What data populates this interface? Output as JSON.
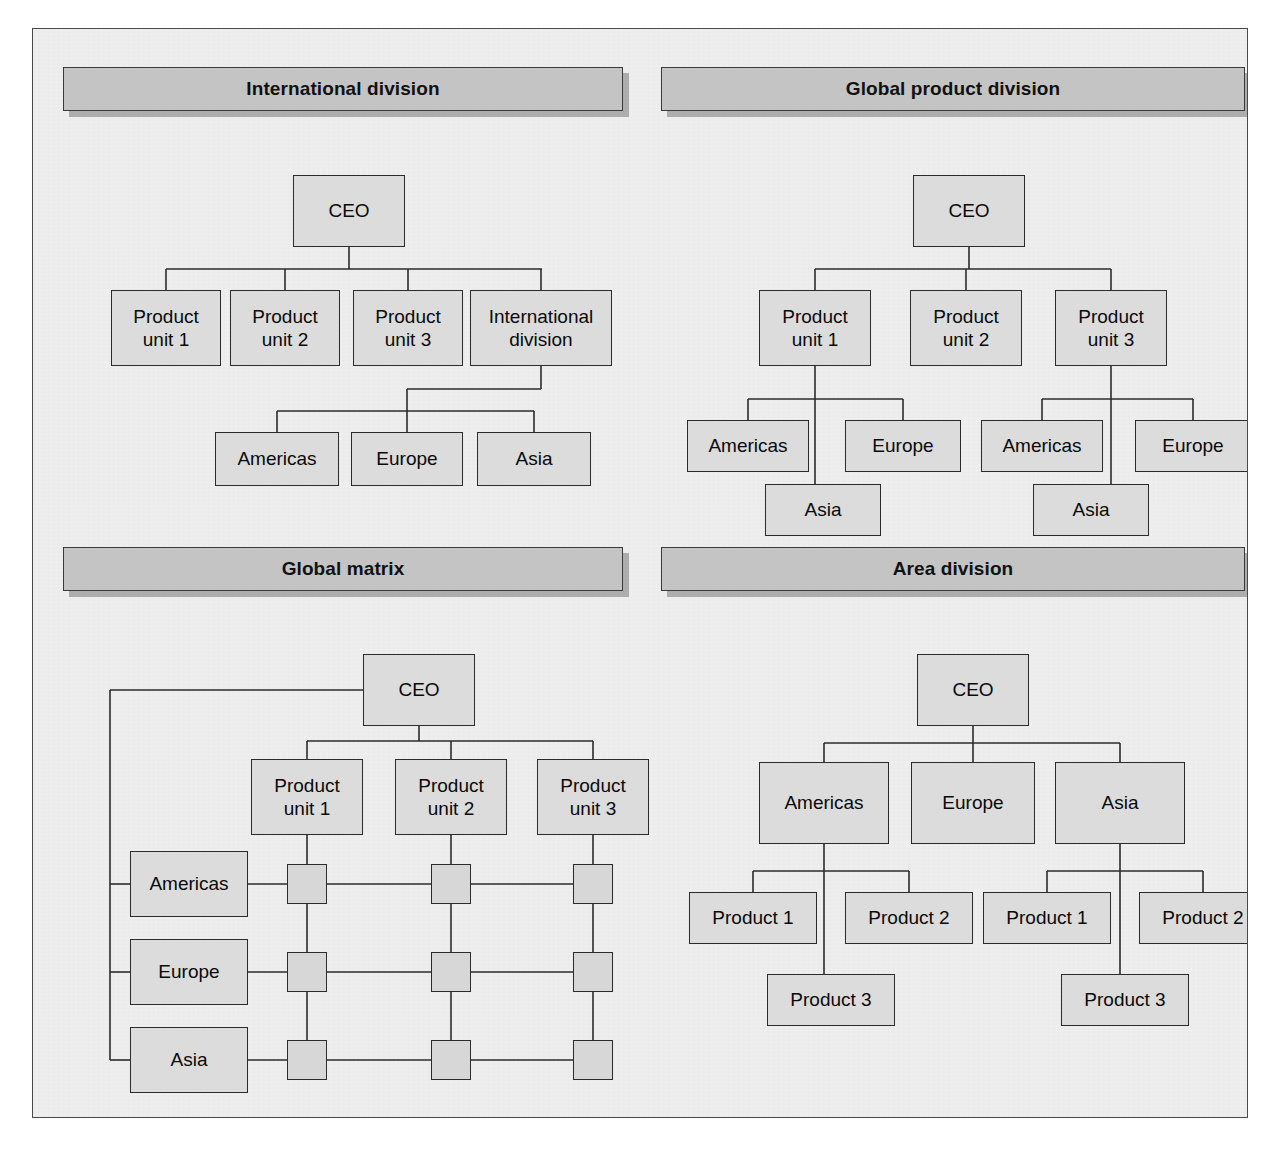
{
  "figure": {
    "background_color": "#eeeeee",
    "box_fill_color": "#dcdcdc",
    "banner_fill_color": "#c4c4c4",
    "line_color": "#2b2b2b"
  },
  "panels": [
    {
      "id": "international-division",
      "title": "International division",
      "nodes": [
        {
          "name": "ceo",
          "label": "CEO",
          "x": 260,
          "y": 146,
          "w": 112,
          "h": 72
        },
        {
          "name": "product-unit-1",
          "label": "Product\nunit 1",
          "x": 78,
          "y": 261,
          "w": 110,
          "h": 76
        },
        {
          "name": "product-unit-2",
          "label": "Product\nunit 2",
          "x": 197,
          "y": 261,
          "w": 110,
          "h": 76
        },
        {
          "name": "product-unit-3",
          "label": "Product\nunit 3",
          "x": 320,
          "y": 261,
          "w": 110,
          "h": 76
        },
        {
          "name": "international-div",
          "label": "International\ndivision",
          "x": 437,
          "y": 261,
          "w": 142,
          "h": 76
        },
        {
          "name": "americas",
          "label": "Americas",
          "x": 182,
          "y": 403,
          "w": 124,
          "h": 54
        },
        {
          "name": "europe",
          "label": "Europe",
          "x": 318,
          "y": 403,
          "w": 112,
          "h": 54
        },
        {
          "name": "asia",
          "label": "Asia",
          "x": 444,
          "y": 403,
          "w": 114,
          "h": 54
        }
      ]
    },
    {
      "id": "global-product-division",
      "title": "Global product division",
      "nodes": [
        {
          "name": "ceo",
          "label": "CEO",
          "x": 880,
          "y": 146,
          "w": 112,
          "h": 72
        },
        {
          "name": "product-unit-1",
          "label": "Product\nunit 1",
          "x": 726,
          "y": 261,
          "w": 112,
          "h": 76
        },
        {
          "name": "product-unit-2",
          "label": "Product\nunit 2",
          "x": 877,
          "y": 261,
          "w": 112,
          "h": 76
        },
        {
          "name": "product-unit-3",
          "label": "Product\nunit 3",
          "x": 1022,
          "y": 261,
          "w": 112,
          "h": 76
        },
        {
          "name": "americas-1",
          "label": "Americas",
          "x": 654,
          "y": 391,
          "w": 122,
          "h": 52
        },
        {
          "name": "europe-1",
          "label": "Europe",
          "x": 812,
          "y": 391,
          "w": 116,
          "h": 52
        },
        {
          "name": "asia-1",
          "label": "Asia",
          "x": 732,
          "y": 455,
          "w": 116,
          "h": 52
        },
        {
          "name": "americas-2",
          "label": "Americas",
          "x": 948,
          "y": 391,
          "w": 122,
          "h": 52
        },
        {
          "name": "europe-2",
          "label": "Europe",
          "x": 1102,
          "y": 391,
          "w": 116,
          "h": 52
        },
        {
          "name": "asia-2",
          "label": "Asia",
          "x": 1000,
          "y": 455,
          "w": 116,
          "h": 52
        }
      ]
    },
    {
      "id": "global-matrix",
      "title": "Global matrix",
      "nodes": [
        {
          "name": "ceo",
          "label": "CEO",
          "x": 330,
          "y": 625,
          "w": 112,
          "h": 72
        },
        {
          "name": "product-unit-1",
          "label": "Product\nunit 1",
          "x": 218,
          "y": 730,
          "w": 112,
          "h": 76
        },
        {
          "name": "product-unit-2",
          "label": "Product\nunit 2",
          "x": 362,
          "y": 730,
          "w": 112,
          "h": 76
        },
        {
          "name": "product-unit-3",
          "label": "Product\nunit 3",
          "x": 504,
          "y": 730,
          "w": 112,
          "h": 76
        },
        {
          "name": "americas",
          "label": "Americas",
          "x": 97,
          "y": 822,
          "w": 118,
          "h": 66
        },
        {
          "name": "europe",
          "label": "Europe",
          "x": 97,
          "y": 910,
          "w": 118,
          "h": 66
        },
        {
          "name": "asia",
          "label": "Asia",
          "x": 97,
          "y": 998,
          "w": 118,
          "h": 66
        }
      ],
      "matrix_nodes": [
        {
          "name": "cell-americas-unit-1",
          "x": 254,
          "y": 835,
          "w": 40,
          "h": 40
        },
        {
          "name": "cell-americas-unit-2",
          "x": 398,
          "y": 835,
          "w": 40,
          "h": 40
        },
        {
          "name": "cell-americas-unit-3",
          "x": 540,
          "y": 835,
          "w": 40,
          "h": 40
        },
        {
          "name": "cell-europe-unit-1",
          "x": 254,
          "y": 923,
          "w": 40,
          "h": 40
        },
        {
          "name": "cell-europe-unit-2",
          "x": 398,
          "y": 923,
          "w": 40,
          "h": 40
        },
        {
          "name": "cell-europe-unit-3",
          "x": 540,
          "y": 923,
          "w": 40,
          "h": 40
        },
        {
          "name": "cell-asia-unit-1",
          "x": 254,
          "y": 1011,
          "w": 40,
          "h": 40
        },
        {
          "name": "cell-asia-unit-2",
          "x": 398,
          "y": 1011,
          "w": 40,
          "h": 40
        },
        {
          "name": "cell-asia-unit-3",
          "x": 540,
          "y": 1011,
          "w": 40,
          "h": 40
        }
      ]
    },
    {
      "id": "area-division",
      "title": "Area division",
      "nodes": [
        {
          "name": "ceo",
          "label": "CEO",
          "x": 884,
          "y": 625,
          "w": 112,
          "h": 72
        },
        {
          "name": "americas",
          "label": "Americas",
          "x": 726,
          "y": 733,
          "w": 130,
          "h": 82
        },
        {
          "name": "europe",
          "label": "Europe",
          "x": 878,
          "y": 733,
          "w": 124,
          "h": 82
        },
        {
          "name": "asia",
          "label": "Asia",
          "x": 1022,
          "y": 733,
          "w": 130,
          "h": 82
        },
        {
          "name": "americas-product-1",
          "label": "Product 1",
          "x": 656,
          "y": 863,
          "w": 128,
          "h": 52
        },
        {
          "name": "americas-product-2",
          "label": "Product 2",
          "x": 812,
          "y": 863,
          "w": 128,
          "h": 52
        },
        {
          "name": "americas-product-3",
          "label": "Product 3",
          "x": 734,
          "y": 945,
          "w": 128,
          "h": 52
        },
        {
          "name": "asia-product-1",
          "label": "Product 1",
          "x": 950,
          "y": 863,
          "w": 128,
          "h": 52
        },
        {
          "name": "asia-product-2",
          "label": "Product 2",
          "x": 1106,
          "y": 863,
          "w": 128,
          "h": 52
        },
        {
          "name": "asia-product-3",
          "label": "Product 3",
          "x": 1028,
          "y": 945,
          "w": 128,
          "h": 52
        }
      ]
    }
  ],
  "banners": [
    {
      "x": 30,
      "y": 38,
      "w": 560,
      "h": 44
    },
    {
      "x": 628,
      "y": 38,
      "w": 584,
      "h": 44
    },
    {
      "x": 30,
      "y": 518,
      "w": 560,
      "h": 44
    },
    {
      "x": 628,
      "y": 518,
      "w": 584,
      "h": 44
    }
  ]
}
